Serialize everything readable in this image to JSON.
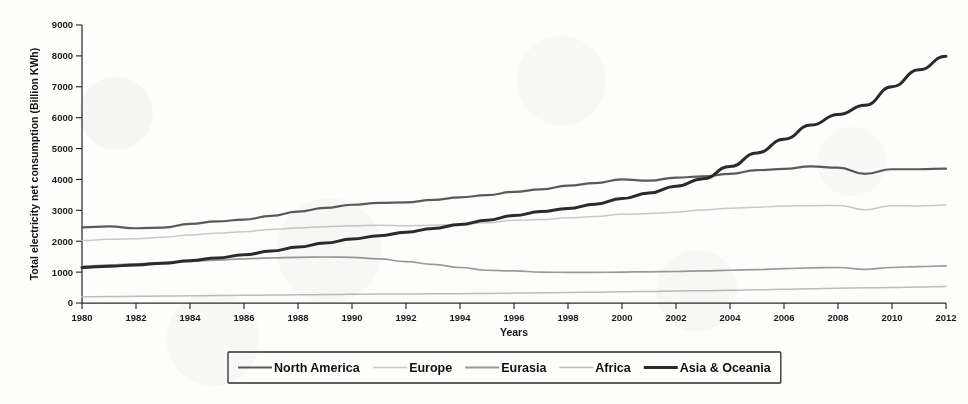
{
  "chart_data": {
    "type": "line",
    "title": "",
    "xlabel": "Years",
    "ylabel": "Total electricity net consumption (Billion KWh)",
    "xlim": [
      1980,
      2012
    ],
    "ylim": [
      0,
      9000
    ],
    "grid": false,
    "legend_position": "bottom",
    "x_tick_labels": [
      "1980",
      "1982",
      "1984",
      "1986",
      "1988",
      "1990",
      "1992",
      "1994",
      "1996",
      "1998",
      "2000",
      "2002",
      "2004",
      "2006",
      "2008",
      "2010",
      "2012"
    ],
    "y_tick_labels": [
      "0",
      "1000",
      "2000",
      "3000",
      "4000",
      "5000",
      "6000",
      "7000",
      "8000",
      "9000"
    ],
    "x_tick_values": [
      1980,
      1982,
      1984,
      1986,
      1988,
      1990,
      1992,
      1994,
      1996,
      1998,
      2000,
      2002,
      2004,
      2006,
      2008,
      2010,
      2012
    ],
    "y_tick_values": [
      0,
      1000,
      2000,
      3000,
      4000,
      5000,
      6000,
      7000,
      8000,
      9000
    ],
    "x": [
      1980,
      1981,
      1982,
      1983,
      1984,
      1985,
      1986,
      1987,
      1988,
      1989,
      1990,
      1991,
      1992,
      1993,
      1994,
      1995,
      1996,
      1997,
      1998,
      1999,
      2000,
      2001,
      2002,
      2003,
      2004,
      2005,
      2006,
      2007,
      2008,
      2009,
      2010,
      2011,
      2012
    ],
    "series": [
      {
        "name": "North America",
        "color": "#5a5a5a",
        "width": 2.2,
        "values": [
          2450,
          2480,
          2420,
          2440,
          2560,
          2640,
          2700,
          2820,
          2960,
          3080,
          3180,
          3240,
          3260,
          3340,
          3420,
          3490,
          3600,
          3680,
          3800,
          3880,
          4000,
          3960,
          4060,
          4100,
          4180,
          4300,
          4340,
          4420,
          4380,
          4180,
          4330,
          4330,
          4350
        ]
      },
      {
        "name": "Europe",
        "color": "#c8c8c8",
        "width": 1.5,
        "values": [
          2020,
          2060,
          2080,
          2130,
          2200,
          2260,
          2310,
          2380,
          2430,
          2470,
          2500,
          2520,
          2500,
          2520,
          2550,
          2600,
          2680,
          2700,
          2760,
          2800,
          2870,
          2900,
          2940,
          3010,
          3070,
          3100,
          3140,
          3150,
          3160,
          3020,
          3150,
          3140,
          3170
        ]
      },
      {
        "name": "Eurasia",
        "color": "#9a9a9a",
        "width": 1.7,
        "values": [
          1190,
          1230,
          1270,
          1310,
          1350,
          1390,
          1430,
          1460,
          1480,
          1490,
          1480,
          1430,
          1340,
          1250,
          1150,
          1060,
          1040,
          1000,
          990,
          990,
          1000,
          1010,
          1020,
          1040,
          1060,
          1080,
          1110,
          1140,
          1150,
          1090,
          1150,
          1180,
          1200
        ]
      },
      {
        "name": "Africa",
        "color": "#bcbcbc",
        "width": 1.5,
        "values": [
          200,
          208,
          216,
          224,
          233,
          242,
          250,
          258,
          266,
          275,
          283,
          288,
          293,
          298,
          303,
          310,
          320,
          330,
          340,
          350,
          362,
          375,
          388,
          400,
          415,
          430,
          445,
          462,
          480,
          490,
          505,
          520,
          535
        ]
      },
      {
        "name": "Asia & Oceania",
        "color": "#2b2b2b",
        "width": 3.0,
        "values": [
          1150,
          1190,
          1230,
          1290,
          1370,
          1460,
          1560,
          1680,
          1810,
          1940,
          2070,
          2180,
          2290,
          2410,
          2540,
          2680,
          2830,
          2960,
          3060,
          3200,
          3380,
          3560,
          3780,
          4020,
          4420,
          4860,
          5300,
          5760,
          6100,
          6400,
          7000,
          7550,
          7990
        ]
      }
    ]
  },
  "legend": {
    "items": [
      {
        "label": "North America",
        "color": "#5a5a5a",
        "width": 2.2
      },
      {
        "label": "Europe",
        "color": "#c8c8c8",
        "width": 1.6
      },
      {
        "label": "Eurasia",
        "color": "#9a9a9a",
        "width": 1.8
      },
      {
        "label": "Africa",
        "color": "#bcbcbc",
        "width": 1.6
      },
      {
        "label": "Asia & Oceania",
        "color": "#2b2b2b",
        "width": 3.0
      }
    ]
  }
}
